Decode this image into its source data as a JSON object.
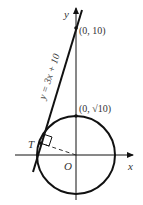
{
  "diagram": {
    "axes": {
      "x_label": "x",
      "y_label": "y",
      "origin_label": "O"
    },
    "line": {
      "equation": "y = 3x + 10"
    },
    "points": {
      "y_intercept": "(0, 10)",
      "circle_top": "(0, √10)",
      "tangent_point": "T"
    },
    "colors": {
      "stroke": "#111111",
      "text": "#333333"
    }
  }
}
